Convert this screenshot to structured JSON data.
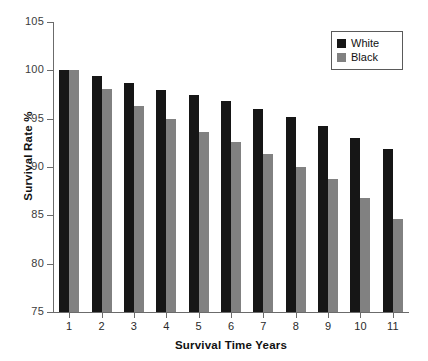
{
  "chart_data": {
    "type": "bar",
    "title": "",
    "xlabel": "Survival Time Years",
    "ylabel": "Survival Rate %",
    "categories": [
      "1",
      "2",
      "3",
      "4",
      "5",
      "6",
      "7",
      "8",
      "9",
      "10",
      "11"
    ],
    "series": [
      {
        "name": "White",
        "color": "#161616",
        "values": [
          100.0,
          99.4,
          98.7,
          98.0,
          97.4,
          96.8,
          96.0,
          95.2,
          94.2,
          93.0,
          91.9
        ]
      },
      {
        "name": "Black",
        "color": "#818181",
        "values": [
          100.0,
          98.1,
          96.3,
          95.0,
          93.6,
          92.6,
          91.3,
          90.0,
          88.8,
          86.8,
          84.6
        ]
      }
    ],
    "ylim": [
      75,
      105
    ],
    "yticks": [
      75,
      80,
      85,
      90,
      95,
      100,
      105
    ],
    "ytick_labels": [
      "75",
      "80",
      "85",
      "90",
      "95",
      "100",
      "105"
    ],
    "grid": false,
    "legend_position": "top-right"
  },
  "legend": {
    "entries": [
      {
        "label": "White",
        "swatch": "#161616"
      },
      {
        "label": "Black",
        "swatch": "#818181"
      }
    ]
  }
}
